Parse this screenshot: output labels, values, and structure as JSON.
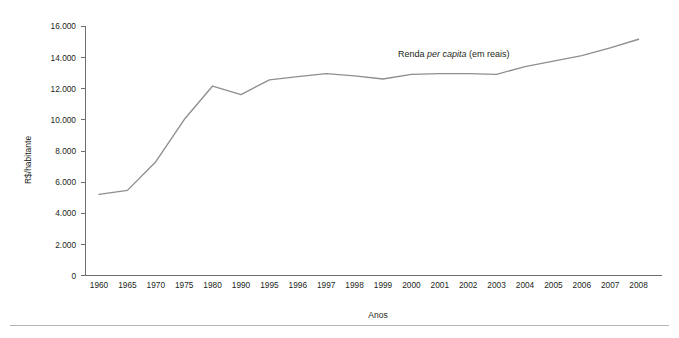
{
  "chart_data": {
    "type": "line",
    "title": "",
    "xlabel": "Anos",
    "ylabel": "R$/habitante",
    "grid": false,
    "legend_position": "inline-annotation",
    "annotation": {
      "text_before": "Renda ",
      "text_emphasis": "per capita",
      "text_after": " (em reais)",
      "full_text": "Renda per capita (em reais)"
    },
    "categories": [
      "1960",
      "1965",
      "1970",
      "1975",
      "1980",
      "1990",
      "1995",
      "1996",
      "1997",
      "1998",
      "1999",
      "2000",
      "2001",
      "2002",
      "2003",
      "2004",
      "2005",
      "2006",
      "2007",
      "2008"
    ],
    "series": [
      {
        "name": "Renda per capita (em reais)",
        "color": "#8e8e8e",
        "values": [
          5200,
          5460,
          7300,
          10000,
          12150,
          11600,
          12550,
          12750,
          12950,
          12800,
          12600,
          12900,
          12950,
          12950,
          12900,
          13400,
          13750,
          14100,
          14600,
          15150
        ]
      }
    ],
    "ylim": [
      0,
      16000
    ],
    "ytick_values": [
      0,
      2000,
      4000,
      6000,
      8000,
      10000,
      12000,
      14000,
      16000
    ],
    "ytick_labels": [
      "0",
      "2.000",
      "4.000",
      "6.000",
      "8.000",
      "10.000",
      "12.000",
      "14.000",
      "16.000"
    ],
    "xlim_categories": 20
  },
  "figure": {
    "axis_color": "#6e6e6e",
    "text_color": "#231f20",
    "background": "#ffffff",
    "footer_rule_color": "#b5b5b5"
  }
}
